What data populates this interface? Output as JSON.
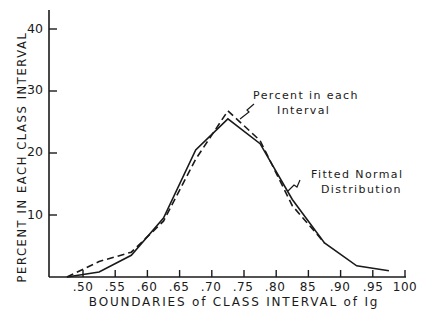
{
  "chart_data": {
    "type": "line",
    "title": "",
    "xlabel": "BOUNDARIES of CLASS INTERVAL of Ig",
    "ylabel": "PERCENT IN EACH CLASS INTERVAL",
    "x_tick_labels": [
      ".50",
      ".55",
      ".60",
      ".65",
      ".70",
      ".75",
      ".80",
      "85",
      ".90",
      ".95",
      "100"
    ],
    "x_tick_values": [
      0.5,
      0.55,
      0.6,
      0.65,
      0.7,
      0.75,
      0.8,
      0.85,
      0.9,
      0.95,
      1.0
    ],
    "y_tick_labels": [
      "10",
      "20",
      "30",
      "40"
    ],
    "y_tick_values": [
      10,
      20,
      30,
      40
    ],
    "xlim": [
      0.45,
      1.0
    ],
    "ylim": [
      0,
      43
    ],
    "grid": false,
    "legend": "none (inline annotations with arrows)",
    "series": [
      {
        "name": "Percent in each Interval",
        "style": "dashed",
        "x": [
          0.475,
          0.525,
          0.575,
          0.625,
          0.675,
          0.725,
          0.775,
          0.825,
          0.875
        ],
        "values": [
          0,
          2.5,
          4.0,
          9.0,
          19.0,
          26.8,
          22.0,
          11.5,
          5.5
        ]
      },
      {
        "name": "Fitted Normal Distribution",
        "style": "solid",
        "x": [
          0.475,
          0.525,
          0.575,
          0.625,
          0.675,
          0.725,
          0.775,
          0.825,
          0.875,
          0.925,
          0.975
        ],
        "values": [
          0,
          0.8,
          3.5,
          9.5,
          20.5,
          25.5,
          21.5,
          12.5,
          5.5,
          1.8,
          1.0
        ]
      }
    ],
    "annotations": [
      {
        "text": "Percent in each Interval",
        "points_to": "dashed line near peak"
      },
      {
        "text": "Fitted Normal Distribution",
        "points_to": "solid line on descending side"
      }
    ]
  },
  "labels": {
    "ylabel": "PERCENT IN EACH CLASS INTERVAL",
    "xlabel": "BOUNDARIES of CLASS INTERVAL of Ig",
    "annot1_line1": "Percent in each",
    "annot1_line2": "Interval",
    "annot2_line1": "Fitted Normal",
    "annot2_line2": "Distribution",
    "yticks": [
      "40",
      "30",
      "20",
      "10"
    ],
    "xticks": [
      ".50",
      ".55",
      ".60",
      ".65",
      ".70",
      ".75",
      ".80",
      "85",
      ".90",
      ".95",
      "100"
    ]
  }
}
